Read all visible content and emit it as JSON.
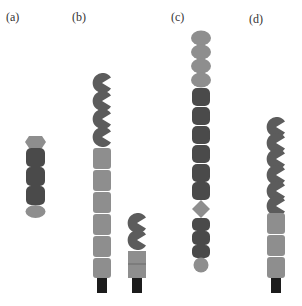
{
  "colors": {
    "dark": "#4a4a4a",
    "light": "#8e8e8e",
    "black": "#1c1c1c",
    "pac": "#5c5c5c"
  },
  "panels": [
    {
      "id": "a",
      "label": "(a)"
    },
    {
      "id": "b",
      "label": "(b)"
    },
    {
      "id": "c",
      "label": "(c)"
    },
    {
      "id": "d",
      "label": "(d)"
    }
  ]
}
